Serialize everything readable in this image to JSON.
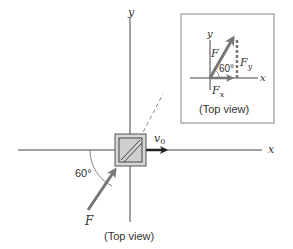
{
  "main": {
    "x_axis_label": "x",
    "y_axis_label": "y",
    "velocity_label": "v",
    "velocity_subscript": "0",
    "force_label": "F",
    "angle_label": "60°",
    "caption": "(Top view)"
  },
  "inset": {
    "x_axis_label": "x",
    "y_axis_label": "y",
    "force_label": "F",
    "fx_label": "F",
    "fx_subscript": "x",
    "fy_label": "F",
    "fy_subscript": "y",
    "angle_label": "60°",
    "caption": "(Top view)"
  },
  "colors": {
    "axis": "#444444",
    "force_arrow": "#777777",
    "velocity_arrow": "#222222",
    "box_border": "#999999",
    "block_fill": "#d6d6d6"
  }
}
